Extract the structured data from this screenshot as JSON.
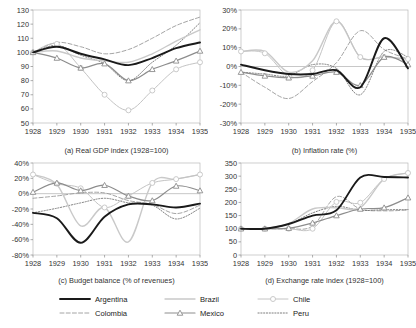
{
  "figure": {
    "background": "#ffffff"
  },
  "series_styles": {
    "Argentina": {
      "color": "#1a1a1a",
      "width": 1.9,
      "dash": "none",
      "marker": "none"
    },
    "Brazil": {
      "color": "#c9c9c9",
      "width": 1.4,
      "dash": "none",
      "marker": "none"
    },
    "Chile": {
      "color": "#c4c4c4",
      "width": 1.0,
      "dash": "none",
      "marker": "circle"
    },
    "Colombia": {
      "color": "#9a9a9a",
      "width": 0.9,
      "dash": "4,2.2",
      "marker": "none"
    },
    "Mexico": {
      "color": "#8d8d8d",
      "width": 1.2,
      "dash": "none",
      "marker": "triangle"
    },
    "Peru": {
      "color": "#707070",
      "width": 0.9,
      "dash": "1.2,1.6",
      "marker": "none"
    }
  },
  "legend": {
    "name": "country-legend",
    "entries": [
      {
        "label": "Argentina",
        "key": "Argentina"
      },
      {
        "label": "Brazil",
        "key": "Brazil"
      },
      {
        "label": "Chile",
        "key": "Chile"
      },
      {
        "label": "Colombia",
        "key": "Colombia"
      },
      {
        "label": "Mexico",
        "key": "Mexico"
      },
      {
        "label": "Peru",
        "key": "Peru"
      }
    ]
  },
  "chart_data": [
    {
      "id": "a",
      "type": "line",
      "title": "(a) Real GDP index (1928=100)",
      "xlabel": "",
      "ylabel": "",
      "x": [
        1928,
        1929,
        1930,
        1931,
        1932,
        1933,
        1934,
        1935
      ],
      "xticklabels": [
        "1928",
        "1929",
        "1930",
        "1931",
        "1932",
        "1933",
        "1934",
        "1935"
      ],
      "ylim": [
        50,
        130
      ],
      "yticks": [
        50,
        60,
        70,
        80,
        90,
        100,
        110,
        120,
        130
      ],
      "yticklabels": [
        "50",
        "60",
        "70",
        "80",
        "90",
        "100",
        "110",
        "120",
        "130"
      ],
      "grid": false,
      "legend_position": "figure-bottom",
      "series": [
        {
          "name": "Argentina",
          "values": [
            100,
            104,
            99,
            95,
            91,
            96,
            103,
            107
          ]
        },
        {
          "name": "Brazil",
          "values": [
            100,
            101,
            96,
            94,
            93,
            99,
            108,
            116
          ]
        },
        {
          "name": "Chile",
          "values": [
            100,
            106,
            89,
            70,
            59,
            73,
            88,
            93
          ]
        },
        {
          "name": "Colombia",
          "values": [
            100,
            107,
            104,
            99,
            102,
            110,
            119,
            125
          ]
        },
        {
          "name": "Mexico",
          "values": [
            100,
            96,
            89,
            92,
            80,
            88,
            94,
            101
          ]
        },
        {
          "name": "Peru",
          "values": [
            100,
            105,
            98,
            92,
            80,
            93,
            105,
            121
          ]
        }
      ]
    },
    {
      "id": "b",
      "type": "line",
      "title": "(b) Inflation rate (%)",
      "xlabel": "",
      "ylabel": "",
      "x": [
        1928,
        1929,
        1930,
        1931,
        1932,
        1933,
        1934,
        1935
      ],
      "xticklabels": [
        "1928",
        "1929",
        "1930",
        "1931",
        "1932",
        "1933",
        "1934",
        "1935"
      ],
      "ylim": [
        -30,
        30
      ],
      "yticks": [
        -30,
        -20,
        -10,
        0,
        10,
        20,
        30
      ],
      "yticklabels": [
        "-30%",
        "-20%",
        "-10%",
        "0%",
        "10%",
        "20%",
        "30%"
      ],
      "grid": false,
      "legend_position": "figure-bottom",
      "series": [
        {
          "name": "Argentina",
          "values": [
            1,
            -2,
            -4,
            -4,
            -2,
            -11,
            15,
            -1
          ]
        },
        {
          "name": "Brazil",
          "values": [
            8,
            8,
            -3,
            3,
            24,
            5,
            5,
            4
          ]
        },
        {
          "name": "Chile",
          "values": [
            8,
            7,
            -5,
            -2,
            24,
            5,
            5,
            4
          ]
        },
        {
          "name": "Colombia",
          "values": [
            -3,
            -11,
            -17,
            -8,
            2,
            19,
            9,
            4
          ]
        },
        {
          "name": "Mexico",
          "values": [
            -3,
            -5,
            -6,
            -5,
            -3,
            -10,
            5,
            1
          ]
        },
        {
          "name": "Peru",
          "values": [
            -3,
            -4,
            -5,
            1,
            -1,
            -15,
            8,
            5
          ]
        }
      ]
    },
    {
      "id": "c",
      "type": "line",
      "title": "(c) Budget balance (% of revenues)",
      "xlabel": "",
      "ylabel": "",
      "x": [
        1928,
        1929,
        1930,
        1931,
        1932,
        1933,
        1934,
        1935
      ],
      "xticklabels": [
        "1928",
        "1929",
        "1930",
        "1931",
        "1932",
        "1933",
        "1934",
        "1935"
      ],
      "ylim": [
        -80,
        40
      ],
      "yticks": [
        -80,
        -60,
        -40,
        -20,
        0,
        20,
        40
      ],
      "yticklabels": [
        "-80%",
        "-60%",
        "-40%",
        "-20%",
        "0%",
        "20%",
        "40%"
      ],
      "grid": false,
      "legend_position": "figure-bottom",
      "series": [
        {
          "name": "Argentina",
          "values": [
            -25,
            -32,
            -64,
            -30,
            -14,
            -14,
            -18,
            -13
          ]
        },
        {
          "name": "Brazil",
          "values": [
            25,
            12,
            -42,
            -18,
            -63,
            14,
            19,
            25
          ]
        },
        {
          "name": "Chile",
          "values": [
            25,
            13,
            7,
            -18,
            -3,
            14,
            19,
            25
          ]
        },
        {
          "name": "Colombia",
          "values": [
            -6,
            -3,
            1,
            1,
            -9,
            -14,
            -26,
            -15
          ]
        },
        {
          "name": "Mexico",
          "values": [
            2,
            14,
            4,
            11,
            -3,
            -9,
            10,
            4
          ]
        },
        {
          "name": "Peru",
          "values": [
            -25,
            -19,
            -12,
            -6,
            -12,
            -15,
            -33,
            -19
          ]
        }
      ]
    },
    {
      "id": "d",
      "type": "line",
      "title": "(d) Exchange rate index (1928=100)",
      "xlabel": "",
      "ylabel": "",
      "x": [
        1928,
        1929,
        1930,
        1931,
        1932,
        1933,
        1934,
        1935
      ],
      "xticklabels": [
        "1928",
        "1929",
        "1930",
        "1931",
        "1932",
        "1933",
        "1934",
        "1935"
      ],
      "ylim": [
        0,
        350
      ],
      "yticks": [
        0,
        50,
        100,
        150,
        200,
        250,
        300,
        350
      ],
      "yticklabels": [
        "0",
        "50",
        "100",
        "150",
        "200",
        "250",
        "300",
        "350"
      ],
      "grid": false,
      "legend_position": "figure-bottom",
      "series": [
        {
          "name": "Argentina",
          "values": [
            100,
            100,
            118,
            150,
            170,
            295,
            297,
            295
          ]
        },
        {
          "name": "Brazil",
          "values": [
            100,
            100,
            120,
            175,
            180,
            180,
            289,
            312
          ]
        },
        {
          "name": "Chile",
          "values": [
            100,
            100,
            100,
            100,
            202,
            199,
            289,
            312
          ]
        },
        {
          "name": "Colombia",
          "values": [
            100,
            100,
            100,
            110,
            222,
            175,
            168,
            171
          ]
        },
        {
          "name": "Mexico",
          "values": [
            100,
            100,
            102,
            122,
            150,
            175,
            180,
            218
          ]
        },
        {
          "name": "Peru",
          "values": [
            100,
            100,
            118,
            160,
            185,
            170,
            172,
            173
          ]
        }
      ]
    }
  ]
}
